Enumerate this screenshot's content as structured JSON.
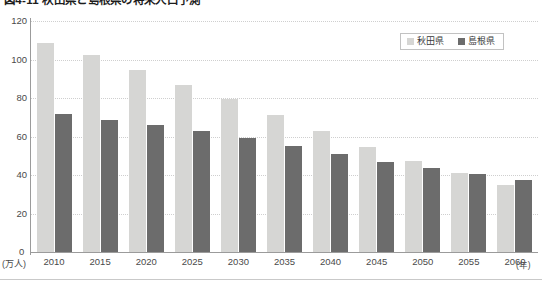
{
  "chart_data": {
    "type": "bar",
    "title": "図4-11 秋田県と島根県の将来人口予測",
    "xlabel": "(年)",
    "ylabel": "(万人)",
    "categories": [
      "2010",
      "2015",
      "2020",
      "2025",
      "2030",
      "2035",
      "2040",
      "2045",
      "2050",
      "2055",
      "2060"
    ],
    "series": [
      {
        "name": "秋田県",
        "color": "#d6d6d4",
        "values": [
          108.6,
          102.3,
          94.5,
          87.0,
          79.5,
          71.0,
          63.0,
          54.5,
          47.5,
          41.0,
          35.0
        ]
      },
      {
        "name": "島根県",
        "color": "#6c6c6c",
        "values": [
          71.7,
          68.5,
          66.0,
          63.0,
          59.0,
          55.0,
          51.0,
          47.0,
          43.5,
          40.5,
          37.5
        ]
      }
    ],
    "ylim": [
      0,
      120
    ],
    "yticks": [
      0,
      20,
      40,
      60,
      80,
      100,
      120
    ],
    "ytick_labels": [
      "0",
      "20",
      "40",
      "60",
      "80",
      "100",
      "120"
    ],
    "grid": true,
    "legend_position": "top-right"
  },
  "legend": {
    "items": [
      {
        "label": "秋田県",
        "color": "#d6d6d4"
      },
      {
        "label": "島根県",
        "color": "#6c6c6c"
      }
    ]
  },
  "axis": {
    "y_unit": "(万人)",
    "x_unit": "(年)",
    "zero": "0"
  }
}
